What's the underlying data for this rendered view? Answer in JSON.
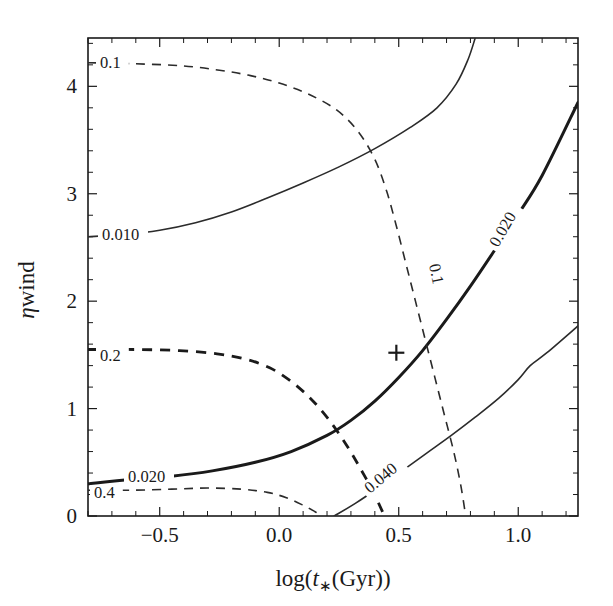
{
  "figure": {
    "background_color": "#ffffff",
    "line_color": "#1a1a1a",
    "plot_box": {
      "left": 88,
      "top": 38,
      "right": 578,
      "bottom": 516
    }
  },
  "axes": {
    "x": {
      "label": "log(t∗(Gyr))",
      "label_parts": {
        "prefix": "log(",
        "italic": "t",
        "subscript": "∗",
        "suffix": "(Gyr))"
      },
      "min": -0.8,
      "max": 1.25,
      "major_ticks": [
        -0.5,
        0.0,
        0.5,
        1.0
      ],
      "major_tick_labels": [
        "−0.5",
        "0.0",
        "0.5",
        "1.0"
      ],
      "minor_tick_step": 0.1
    },
    "y": {
      "label": "η wind",
      "label_parts": {
        "italic": "η",
        "suffix": "wind"
      },
      "min": 0.0,
      "max": 4.45,
      "major_ticks": [
        0,
        1,
        2,
        3,
        4
      ],
      "major_tick_labels": [
        "0",
        "1",
        "2",
        "3",
        "4"
      ],
      "minor_tick_step": 0.2
    }
  },
  "marker": {
    "symbol": "+",
    "x": 0.49,
    "y": 1.52
  },
  "contour_labels": [
    {
      "text": "0.1",
      "x": 100,
      "y": 68,
      "rotate": 0,
      "style": "dashed-thin"
    },
    {
      "text": "0.010",
      "x": 102,
      "y": 240,
      "rotate": 0,
      "style": "solid-thin"
    },
    {
      "text": "0.2",
      "x": 100,
      "y": 361,
      "rotate": 0,
      "style": "dashed-thick"
    },
    {
      "text": "0.020",
      "x": 128,
      "y": 482,
      "rotate": 0,
      "style": "solid-thick"
    },
    {
      "text": "0.4",
      "x": 94,
      "y": 498,
      "rotate": 0,
      "style": "dashed-thin"
    },
    {
      "text": "0.1",
      "x": 429,
      "y": 265,
      "rotate": 78,
      "style": "dashed-thin"
    },
    {
      "text": "0.020",
      "x": 498,
      "y": 248,
      "rotate": -60,
      "style": "solid-thick"
    },
    {
      "text": "0.040",
      "x": 370,
      "y": 494,
      "rotate": -40,
      "style": "solid-thin"
    }
  ],
  "chart_data": {
    "type": "line",
    "title": "",
    "xlabel": "log(t∗(Gyr))",
    "ylabel": "η wind",
    "xlim": [
      -0.8,
      1.25
    ],
    "ylim": [
      0.0,
      4.45
    ],
    "grid": false,
    "legend": "none",
    "series": [
      {
        "name": "0.010",
        "label": "0.010",
        "style": "solid",
        "weight": "thin",
        "points": [
          [
            -0.8,
            2.6
          ],
          [
            -0.65,
            2.62
          ],
          [
            -0.5,
            2.66
          ],
          [
            -0.35,
            2.73
          ],
          [
            -0.2,
            2.83
          ],
          [
            -0.05,
            2.96
          ],
          [
            0.1,
            3.1
          ],
          [
            0.25,
            3.25
          ],
          [
            0.4,
            3.42
          ],
          [
            0.55,
            3.62
          ],
          [
            0.66,
            3.8
          ],
          [
            0.74,
            4.02
          ],
          [
            0.79,
            4.25
          ],
          [
            0.82,
            4.45
          ]
        ]
      },
      {
        "name": "0.020",
        "label": "0.020",
        "style": "solid",
        "weight": "thick",
        "points": [
          [
            -0.8,
            0.3
          ],
          [
            -0.62,
            0.34
          ],
          [
            -0.45,
            0.37
          ],
          [
            -0.28,
            0.42
          ],
          [
            -0.1,
            0.5
          ],
          [
            0.05,
            0.6
          ],
          [
            0.2,
            0.75
          ],
          [
            0.3,
            0.89
          ],
          [
            0.4,
            1.07
          ],
          [
            0.5,
            1.29
          ],
          [
            0.6,
            1.54
          ],
          [
            0.7,
            1.83
          ],
          [
            0.8,
            2.14
          ],
          [
            0.9,
            2.47
          ],
          [
            1.0,
            2.81
          ],
          [
            1.1,
            3.17
          ],
          [
            1.25,
            3.85
          ]
        ]
      },
      {
        "name": "0.040",
        "label": "0.040",
        "style": "solid",
        "weight": "thin",
        "points": [
          [
            0.23,
            0.0
          ],
          [
            0.32,
            0.12
          ],
          [
            0.42,
            0.27
          ],
          [
            0.52,
            0.43
          ],
          [
            0.62,
            0.59
          ],
          [
            0.72,
            0.75
          ],
          [
            0.82,
            0.92
          ],
          [
            0.92,
            1.1
          ],
          [
            1.0,
            1.27
          ],
          [
            1.05,
            1.4
          ],
          [
            1.12,
            1.52
          ],
          [
            1.25,
            1.77
          ]
        ]
      },
      {
        "name": "0.1",
        "label": "0.1",
        "style": "dashed",
        "weight": "thin",
        "points": [
          [
            -0.8,
            4.22
          ],
          [
            -0.6,
            4.21
          ],
          [
            -0.4,
            4.19
          ],
          [
            -0.25,
            4.15
          ],
          [
            -0.12,
            4.1
          ],
          [
            0.0,
            4.03
          ],
          [
            0.12,
            3.93
          ],
          [
            0.24,
            3.78
          ],
          [
            0.33,
            3.58
          ],
          [
            0.4,
            3.32
          ],
          [
            0.45,
            3.02
          ],
          [
            0.49,
            2.7
          ],
          [
            0.53,
            2.35
          ],
          [
            0.57,
            2.0
          ],
          [
            0.61,
            1.65
          ],
          [
            0.65,
            1.3
          ],
          [
            0.69,
            0.95
          ],
          [
            0.73,
            0.6
          ],
          [
            0.76,
            0.28
          ],
          [
            0.78,
            0.0
          ]
        ]
      },
      {
        "name": "0.2",
        "label": "0.2",
        "style": "dashed",
        "weight": "thick",
        "points": [
          [
            -0.8,
            1.55
          ],
          [
            -0.6,
            1.55
          ],
          [
            -0.42,
            1.54
          ],
          [
            -0.26,
            1.51
          ],
          [
            -0.14,
            1.46
          ],
          [
            -0.04,
            1.38
          ],
          [
            0.04,
            1.27
          ],
          [
            0.11,
            1.14
          ],
          [
            0.17,
            1.0
          ],
          [
            0.23,
            0.83
          ],
          [
            0.29,
            0.63
          ],
          [
            0.34,
            0.44
          ],
          [
            0.39,
            0.24
          ],
          [
            0.43,
            0.05
          ],
          [
            0.44,
            0.0
          ]
        ]
      },
      {
        "name": "0.4",
        "label": "0.4",
        "style": "dashed",
        "weight": "thin",
        "points": [
          [
            -0.8,
            0.24
          ],
          [
            -0.62,
            0.24
          ],
          [
            -0.45,
            0.25
          ],
          [
            -0.3,
            0.26
          ],
          [
            -0.16,
            0.25
          ],
          [
            -0.05,
            0.22
          ],
          [
            0.03,
            0.17
          ],
          [
            0.1,
            0.1
          ],
          [
            0.15,
            0.04
          ],
          [
            0.18,
            0.0
          ]
        ]
      }
    ]
  }
}
